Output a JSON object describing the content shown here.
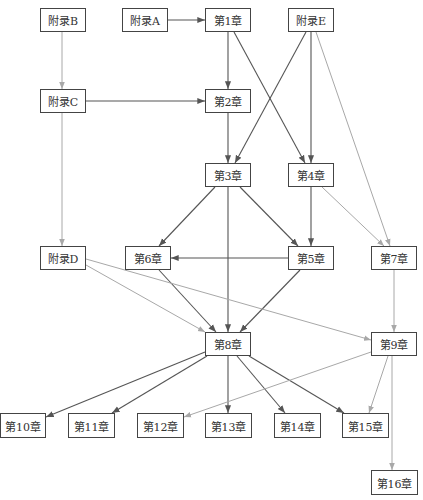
{
  "colors": {
    "dark_edge": "#555555",
    "light_edge": "#a8a8a8",
    "node_border": "#444444",
    "text": "#333333"
  },
  "nodes": [
    {
      "id": "appB",
      "label": "附录B",
      "x": 40,
      "y": 8,
      "w": 46,
      "h": 24
    },
    {
      "id": "appA",
      "label": "附录A",
      "x": 122,
      "y": 8,
      "w": 46,
      "h": 24
    },
    {
      "id": "ch1",
      "label": "第1章",
      "x": 205,
      "y": 8,
      "w": 46,
      "h": 24
    },
    {
      "id": "appE",
      "label": "附录E",
      "x": 288,
      "y": 8,
      "w": 46,
      "h": 24
    },
    {
      "id": "appC",
      "label": "附录C",
      "x": 40,
      "y": 89,
      "w": 46,
      "h": 24
    },
    {
      "id": "ch2",
      "label": "第2章",
      "x": 205,
      "y": 89,
      "w": 46,
      "h": 24
    },
    {
      "id": "ch3",
      "label": "第3章",
      "x": 205,
      "y": 163,
      "w": 46,
      "h": 24
    },
    {
      "id": "ch4",
      "label": "第4章",
      "x": 288,
      "y": 163,
      "w": 46,
      "h": 24
    },
    {
      "id": "appD",
      "label": "附录D",
      "x": 40,
      "y": 246,
      "w": 46,
      "h": 24
    },
    {
      "id": "ch6",
      "label": "第6章",
      "x": 125,
      "y": 246,
      "w": 46,
      "h": 24
    },
    {
      "id": "ch5",
      "label": "第5章",
      "x": 288,
      "y": 246,
      "w": 46,
      "h": 24
    },
    {
      "id": "ch7",
      "label": "第7章",
      "x": 371,
      "y": 246,
      "w": 46,
      "h": 24
    },
    {
      "id": "ch8",
      "label": "第8章",
      "x": 205,
      "y": 332,
      "w": 46,
      "h": 24
    },
    {
      "id": "ch9",
      "label": "第9章",
      "x": 371,
      "y": 332,
      "w": 46,
      "h": 24
    },
    {
      "id": "ch10",
      "label": "第10章",
      "x": 0,
      "y": 413,
      "w": 46,
      "h": 25
    },
    {
      "id": "ch11",
      "label": "第11章",
      "x": 68,
      "y": 413,
      "w": 47,
      "h": 25
    },
    {
      "id": "ch12",
      "label": "第12章",
      "x": 137,
      "y": 413,
      "w": 47,
      "h": 25
    },
    {
      "id": "ch13",
      "label": "第13章",
      "x": 205,
      "y": 413,
      "w": 47,
      "h": 25
    },
    {
      "id": "ch14",
      "label": "第14章",
      "x": 274,
      "y": 413,
      "w": 47,
      "h": 25
    },
    {
      "id": "ch15",
      "label": "第15章",
      "x": 342,
      "y": 413,
      "w": 47,
      "h": 25
    },
    {
      "id": "ch16",
      "label": "第16章",
      "x": 371,
      "y": 470,
      "w": 47,
      "h": 25
    }
  ],
  "edges": [
    {
      "from": "appA",
      "to": "ch1",
      "x1": 168,
      "y1": 20,
      "x2": 205,
      "y2": 20,
      "style": "dark"
    },
    {
      "from": "appB",
      "to": "appC",
      "x1": 62,
      "y1": 32,
      "x2": 62,
      "y2": 89,
      "style": "light"
    },
    {
      "from": "appC",
      "to": "ch2",
      "x1": 86,
      "y1": 101,
      "x2": 205,
      "y2": 101,
      "style": "dark"
    },
    {
      "from": "ch1",
      "to": "ch2",
      "x1": 228,
      "y1": 32,
      "x2": 228,
      "y2": 89,
      "style": "dark"
    },
    {
      "from": "ch1",
      "to": "ch4",
      "x1": 234,
      "y1": 32,
      "x2": 305,
      "y2": 163,
      "style": "dark"
    },
    {
      "from": "appE",
      "to": "ch3",
      "x1": 306,
      "y1": 32,
      "x2": 235,
      "y2": 163,
      "style": "dark"
    },
    {
      "from": "appE",
      "to": "ch4",
      "x1": 311,
      "y1": 32,
      "x2": 311,
      "y2": 163,
      "style": "dark"
    },
    {
      "from": "appE",
      "to": "ch7",
      "x1": 316,
      "y1": 32,
      "x2": 390,
      "y2": 246,
      "style": "light"
    },
    {
      "from": "ch2",
      "to": "ch3",
      "x1": 228,
      "y1": 113,
      "x2": 228,
      "y2": 163,
      "style": "dark"
    },
    {
      "from": "appC",
      "to": "appD",
      "x1": 62,
      "y1": 113,
      "x2": 62,
      "y2": 246,
      "style": "light"
    },
    {
      "from": "ch3",
      "to": "ch6",
      "x1": 215,
      "y1": 187,
      "x2": 159,
      "y2": 246,
      "style": "dark"
    },
    {
      "from": "ch3",
      "to": "ch5",
      "x1": 240,
      "y1": 187,
      "x2": 298,
      "y2": 246,
      "style": "dark"
    },
    {
      "from": "ch3",
      "to": "ch8",
      "x1": 228,
      "y1": 187,
      "x2": 228,
      "y2": 332,
      "style": "dark"
    },
    {
      "from": "ch4",
      "to": "ch5",
      "x1": 311,
      "y1": 187,
      "x2": 311,
      "y2": 246,
      "style": "dark"
    },
    {
      "from": "ch4",
      "to": "ch7",
      "x1": 322,
      "y1": 187,
      "x2": 384,
      "y2": 246,
      "style": "light"
    },
    {
      "from": "ch5",
      "to": "ch6",
      "x1": 288,
      "y1": 258,
      "x2": 171,
      "y2": 258,
      "style": "dark"
    },
    {
      "from": "ch6",
      "to": "ch8",
      "x1": 159,
      "y1": 270,
      "x2": 216,
      "y2": 332,
      "style": "dark"
    },
    {
      "from": "ch5",
      "to": "ch8",
      "x1": 300,
      "y1": 270,
      "x2": 240,
      "y2": 332,
      "style": "dark"
    },
    {
      "from": "appD",
      "to": "ch8",
      "x1": 86,
      "y1": 265,
      "x2": 205,
      "y2": 332,
      "style": "light"
    },
    {
      "from": "appD",
      "to": "ch9",
      "x1": 86,
      "y1": 259,
      "x2": 371,
      "y2": 340,
      "style": "light"
    },
    {
      "from": "ch7",
      "to": "ch9",
      "x1": 394,
      "y1": 270,
      "x2": 394,
      "y2": 332,
      "style": "light"
    },
    {
      "from": "ch8",
      "to": "ch10",
      "x1": 205,
      "y1": 352,
      "x2": 46,
      "y2": 417,
      "style": "dark"
    },
    {
      "from": "ch8",
      "to": "ch11",
      "x1": 207,
      "y1": 356,
      "x2": 112,
      "y2": 413,
      "style": "dark"
    },
    {
      "from": "ch8",
      "to": "ch13",
      "x1": 228,
      "y1": 356,
      "x2": 228,
      "y2": 413,
      "style": "dark"
    },
    {
      "from": "ch8",
      "to": "ch14",
      "x1": 237,
      "y1": 356,
      "x2": 285,
      "y2": 413,
      "style": "dark"
    },
    {
      "from": "ch8",
      "to": "ch15",
      "x1": 249,
      "y1": 356,
      "x2": 344,
      "y2": 413,
      "style": "dark"
    },
    {
      "from": "ch9",
      "to": "ch12",
      "x1": 371,
      "y1": 352,
      "x2": 184,
      "y2": 417,
      "style": "light"
    },
    {
      "from": "ch9",
      "to": "ch15",
      "x1": 388,
      "y1": 356,
      "x2": 369,
      "y2": 413,
      "style": "light"
    },
    {
      "from": "ch9",
      "to": "ch16",
      "x1": 392,
      "y1": 356,
      "x2": 392,
      "y2": 470,
      "style": "light"
    }
  ]
}
